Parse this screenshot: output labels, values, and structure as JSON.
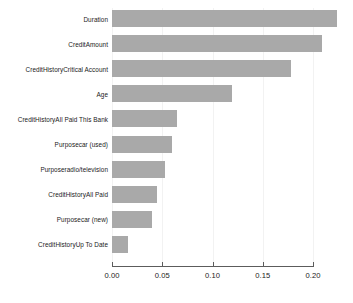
{
  "chart_data": {
    "type": "bar",
    "orientation": "horizontal",
    "title": "",
    "subtitle": "",
    "xlabel": "",
    "ylabel": "",
    "xlim": [
      0.0,
      0.2294
    ],
    "xticks": [
      0.0,
      0.05,
      0.1,
      0.15,
      0.2
    ],
    "xticklabels": [
      "0.00",
      "0.05",
      "0.10",
      "0.15",
      "0.20"
    ],
    "grid": true,
    "grid_axis": "x",
    "legend": false,
    "legend_position": "none",
    "bar_color": "#a9a9a9",
    "axis_color": "#5c5c5c",
    "categories": [
      "Duration",
      "CreditAmount",
      "CreditHistoryCritical Account",
      "Age",
      "CreditHistoryAll Paid This Bank",
      "Purposecar (used)",
      "Purposeradio/television",
      "CreditHistoryAll Paid",
      "Purposecar (new)",
      "CreditHistoryUp To Date"
    ],
    "values": [
      0.224,
      0.209,
      0.178,
      0.119,
      0.065,
      0.06,
      0.053,
      0.045,
      0.04,
      0.016
    ]
  }
}
